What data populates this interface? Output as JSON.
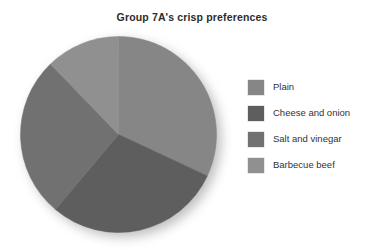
{
  "chart_data": {
    "type": "pie",
    "title": "Group 7A's crisp preferences",
    "xlabel": "",
    "ylabel": "",
    "legend_position": "right",
    "grid": false,
    "categories": [
      "Plain",
      "Cheese and onion",
      "Salt and vinegar",
      "Barbecue beef"
    ],
    "values": [
      32,
      29,
      27,
      12
    ],
    "unit": "percent",
    "start_angle_deg": 0,
    "direction": "clockwise",
    "slices": [
      {
        "label": "Plain",
        "value": 32,
        "color": "#868686",
        "start_deg": 0,
        "end_deg": 115
      },
      {
        "label": "Cheese and onion",
        "value": 29,
        "color": "#5e5e5e",
        "start_deg": 115,
        "end_deg": 220
      },
      {
        "label": "Salt and vinegar",
        "value": 27,
        "color": "#717171",
        "start_deg": 220,
        "end_deg": 316
      },
      {
        "label": "Barbecue beef",
        "value": 12,
        "color": "#909090",
        "start_deg": 316,
        "end_deg": 360
      }
    ]
  },
  "title": {
    "text": "Group 7A's crisp preferences"
  },
  "legend": {
    "items": [
      {
        "label": "Plain",
        "color": "#868686"
      },
      {
        "label": "Cheese and onion",
        "color": "#5e5e5e"
      },
      {
        "label": "Salt and vinegar",
        "color": "#717171"
      },
      {
        "label": "Barbecue beef",
        "color": "#909090"
      }
    ]
  },
  "colors": {
    "background": "#ffffff",
    "title_text": "#2c2c2c",
    "legend_text": "#333333",
    "shadow": "#9a9a9a"
  }
}
